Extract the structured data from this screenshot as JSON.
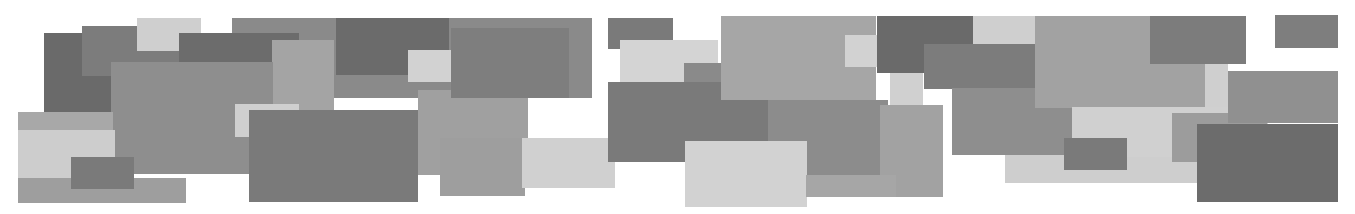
{
  "artwork": {
    "background": "#ffffff",
    "width": 1355,
    "height": 214,
    "rects": [
      {
        "x": 232,
        "y": 18,
        "w": 360,
        "h": 80,
        "c": "#8a8a8a"
      },
      {
        "x": 44,
        "y": 33,
        "w": 68,
        "h": 97,
        "c": "#6a6a6a"
      },
      {
        "x": 82,
        "y": 26,
        "w": 97,
        "h": 50,
        "c": "#7c7c7c"
      },
      {
        "x": 137,
        "y": 18,
        "w": 64,
        "h": 33,
        "c": "#cfcfcf"
      },
      {
        "x": 179,
        "y": 33,
        "w": 120,
        "h": 30,
        "c": "#6c6c6c"
      },
      {
        "x": 336,
        "y": 18,
        "w": 113,
        "h": 57,
        "c": "#6b6b6b"
      },
      {
        "x": 272,
        "y": 40,
        "w": 62,
        "h": 76,
        "c": "#a4a4a4"
      },
      {
        "x": 111,
        "y": 62,
        "w": 162,
        "h": 112,
        "c": "#8e8e8e"
      },
      {
        "x": 18,
        "y": 112,
        "w": 95,
        "h": 20,
        "c": "#a8a8a8"
      },
      {
        "x": 18,
        "y": 130,
        "w": 97,
        "h": 52,
        "c": "#cdcdcd"
      },
      {
        "x": 18,
        "y": 178,
        "w": 168,
        "h": 25,
        "c": "#9e9e9e"
      },
      {
        "x": 71,
        "y": 157,
        "w": 63,
        "h": 32,
        "c": "#7a7a7a"
      },
      {
        "x": 235,
        "y": 104,
        "w": 64,
        "h": 33,
        "c": "#cfcfcf"
      },
      {
        "x": 249,
        "y": 110,
        "w": 169,
        "h": 92,
        "c": "#7a7a7a"
      },
      {
        "x": 418,
        "y": 90,
        "w": 110,
        "h": 85,
        "c": "#a0a0a0"
      },
      {
        "x": 408,
        "y": 50,
        "w": 64,
        "h": 32,
        "c": "#d2d2d2"
      },
      {
        "x": 451,
        "y": 28,
        "w": 118,
        "h": 70,
        "c": "#7e7e7e"
      },
      {
        "x": 440,
        "y": 138,
        "w": 85,
        "h": 58,
        "c": "#9e9e9e"
      },
      {
        "x": 522,
        "y": 138,
        "w": 93,
        "h": 50,
        "c": "#d0d0d0"
      },
      {
        "x": 608,
        "y": 18,
        "w": 65,
        "h": 31,
        "c": "#7a7a7a"
      },
      {
        "x": 620,
        "y": 40,
        "w": 98,
        "h": 42,
        "c": "#d4d4d4"
      },
      {
        "x": 684,
        "y": 63,
        "w": 40,
        "h": 20,
        "c": "#8a8a8a"
      },
      {
        "x": 608,
        "y": 82,
        "w": 160,
        "h": 80,
        "c": "#7a7a7a"
      },
      {
        "x": 768,
        "y": 100,
        "w": 120,
        "h": 75,
        "c": "#8c8c8c"
      },
      {
        "x": 721,
        "y": 16,
        "w": 155,
        "h": 84,
        "c": "#a6a6a6"
      },
      {
        "x": 845,
        "y": 35,
        "w": 62,
        "h": 32,
        "c": "#d2d2d2"
      },
      {
        "x": 877,
        "y": 16,
        "w": 96,
        "h": 57,
        "c": "#6a6a6a"
      },
      {
        "x": 973,
        "y": 16,
        "w": 62,
        "h": 28,
        "c": "#cfcfcf"
      },
      {
        "x": 924,
        "y": 44,
        "w": 111,
        "h": 45,
        "c": "#7c7c7c"
      },
      {
        "x": 890,
        "y": 73,
        "w": 33,
        "h": 32,
        "c": "#d0d0d0"
      },
      {
        "x": 880,
        "y": 105,
        "w": 63,
        "h": 92,
        "c": "#a2a2a2"
      },
      {
        "x": 952,
        "y": 88,
        "w": 120,
        "h": 67,
        "c": "#8e8e8e"
      },
      {
        "x": 1035,
        "y": 16,
        "w": 170,
        "h": 92,
        "c": "#a2a2a2"
      },
      {
        "x": 1150,
        "y": 16,
        "w": 96,
        "h": 48,
        "c": "#7c7c7c"
      },
      {
        "x": 1205,
        "y": 64,
        "w": 23,
        "h": 50,
        "c": "#cfcfcf"
      },
      {
        "x": 1005,
        "y": 155,
        "w": 290,
        "h": 28,
        "c": "#cecece"
      },
      {
        "x": 1072,
        "y": 107,
        "w": 196,
        "h": 50,
        "c": "#d0d0d0"
      },
      {
        "x": 1064,
        "y": 138,
        "w": 63,
        "h": 32,
        "c": "#7a7a7a"
      },
      {
        "x": 1172,
        "y": 113,
        "w": 95,
        "h": 49,
        "c": "#9c9c9c"
      },
      {
        "x": 1228,
        "y": 71,
        "w": 110,
        "h": 52,
        "c": "#909090"
      },
      {
        "x": 1275,
        "y": 15,
        "w": 63,
        "h": 33,
        "c": "#7e7e7e"
      },
      {
        "x": 1197,
        "y": 124,
        "w": 141,
        "h": 78,
        "c": "#6c6c6c"
      },
      {
        "x": 685,
        "y": 141,
        "w": 122,
        "h": 66,
        "c": "#d2d2d2"
      },
      {
        "x": 806,
        "y": 175,
        "w": 90,
        "h": 22,
        "c": "#a6a6a6"
      }
    ]
  }
}
